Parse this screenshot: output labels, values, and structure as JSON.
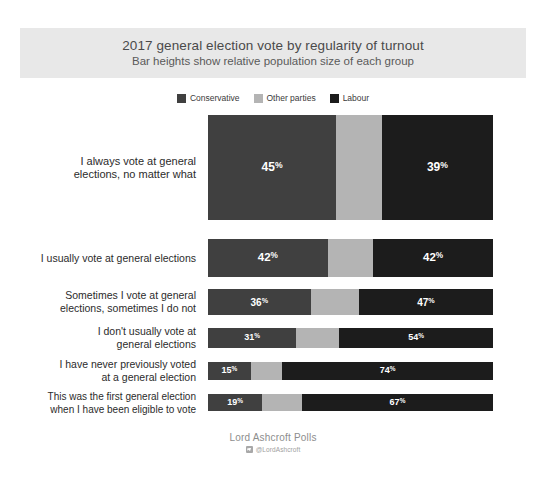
{
  "header": {
    "title": "2017 general election vote by regularity of turnout",
    "subtitle": "Bar heights show relative population size of each group"
  },
  "legend": {
    "position": "top-center",
    "items": [
      {
        "label": "Conservative",
        "color": "#404040"
      },
      {
        "label": "Other parties",
        "color": "#b4b4b4"
      },
      {
        "label": "Labour",
        "color": "#1c1c1c"
      }
    ]
  },
  "footer": {
    "source": "Lord Ashcroft Polls",
    "handle": "@LordAshcroft",
    "badge_icon": "twitter-icon"
  },
  "chart_data": {
    "type": "bar",
    "orientation": "horizontal",
    "stacked": true,
    "stacked_percent": true,
    "title": "2017 general election vote by regularity of turnout",
    "subtitle": "Bar heights show relative population size of each group",
    "xlabel": "",
    "ylabel": "",
    "xlim": [
      0,
      100
    ],
    "grid": false,
    "legend_position": "top-center",
    "note": "Bar thickness (height) encodes relative population size of each group",
    "categories": [
      "I always vote at general elections, no matter what",
      "I usually vote at general elections",
      "Sometimes I vote at general elections, sometimes I do not",
      "I don't usually vote at general elections",
      "I have never previously voted at a general election",
      "This was the first general election when I have been eligible to vote"
    ],
    "series": [
      {
        "name": "Conservative",
        "color": "#404040",
        "values": [
          45,
          42,
          36,
          31,
          15,
          19
        ]
      },
      {
        "name": "Other parties",
        "color": "#b4b4b4",
        "values": [
          16,
          16,
          17,
          15,
          11,
          14
        ]
      },
      {
        "name": "Labour",
        "color": "#1c1c1c",
        "values": [
          39,
          42,
          47,
          54,
          74,
          67
        ]
      }
    ],
    "bar_thickness": [
      105,
      38,
      26,
      20,
      18,
      17
    ]
  },
  "rows": [
    {
      "label": "I always vote at general\nelections, no matter what",
      "thickness": 105,
      "top": 2,
      "font": 12,
      "label_font": 11,
      "segments": [
        {
          "party": "Conservative",
          "value": 45,
          "label": "45",
          "color": "#404040",
          "show_label": true
        },
        {
          "party": "Other parties",
          "value": 16,
          "label": "16",
          "color": "#b4b4b4",
          "show_label": false
        },
        {
          "party": "Labour",
          "value": 39,
          "label": "39",
          "color": "#1c1c1c",
          "show_label": true
        }
      ]
    },
    {
      "label": "I usually vote at general elections",
      "thickness": 38,
      "top": 126,
      "font": 11.5,
      "label_font": 10.5,
      "segments": [
        {
          "party": "Conservative",
          "value": 42,
          "label": "42",
          "color": "#404040",
          "show_label": true
        },
        {
          "party": "Other parties",
          "value": 16,
          "label": "16",
          "color": "#b4b4b4",
          "show_label": false
        },
        {
          "party": "Labour",
          "value": 42,
          "label": "42",
          "color": "#1c1c1c",
          "show_label": true
        }
      ]
    },
    {
      "label": "Sometimes I vote at general\nelections, sometimes I do not",
      "thickness": 26,
      "top": 176,
      "font": 10,
      "label_font": 10.5,
      "segments": [
        {
          "party": "Conservative",
          "value": 36,
          "label": "36",
          "color": "#404040",
          "show_label": true
        },
        {
          "party": "Other parties",
          "value": 17,
          "label": "17",
          "color": "#b4b4b4",
          "show_label": false
        },
        {
          "party": "Labour",
          "value": 47,
          "label": "47",
          "color": "#1c1c1c",
          "show_label": true
        }
      ]
    },
    {
      "label": "I don't usually vote at\ngeneral elections",
      "thickness": 20,
      "top": 215,
      "font": 9,
      "label_font": 10.5,
      "segments": [
        {
          "party": "Conservative",
          "value": 31,
          "label": "31",
          "color": "#404040",
          "show_label": true
        },
        {
          "party": "Other parties",
          "value": 15,
          "label": "15",
          "color": "#b4b4b4",
          "show_label": false
        },
        {
          "party": "Labour",
          "value": 54,
          "label": "54",
          "color": "#1c1c1c",
          "show_label": true
        }
      ]
    },
    {
      "label": "I have never previously voted\nat a general election",
      "thickness": 18,
      "top": 249,
      "font": 9,
      "label_font": 10.5,
      "segments": [
        {
          "party": "Conservative",
          "value": 15,
          "label": "15",
          "color": "#404040",
          "show_label": true
        },
        {
          "party": "Other parties",
          "value": 11,
          "label": "11",
          "color": "#b4b4b4",
          "show_label": false
        },
        {
          "party": "Labour",
          "value": 74,
          "label": "74",
          "color": "#1c1c1c",
          "show_label": true
        }
      ]
    },
    {
      "label": "This was the first general election\nwhen I have been eligible to vote",
      "thickness": 17,
      "top": 281,
      "font": 9,
      "label_font": 10,
      "segments": [
        {
          "party": "Conservative",
          "value": 19,
          "label": "19",
          "color": "#404040",
          "show_label": true
        },
        {
          "party": "Other parties",
          "value": 14,
          "label": "14",
          "color": "#b4b4b4",
          "show_label": false
        },
        {
          "party": "Labour",
          "value": 67,
          "label": "67",
          "color": "#1c1c1c",
          "show_label": true
        }
      ]
    }
  ]
}
